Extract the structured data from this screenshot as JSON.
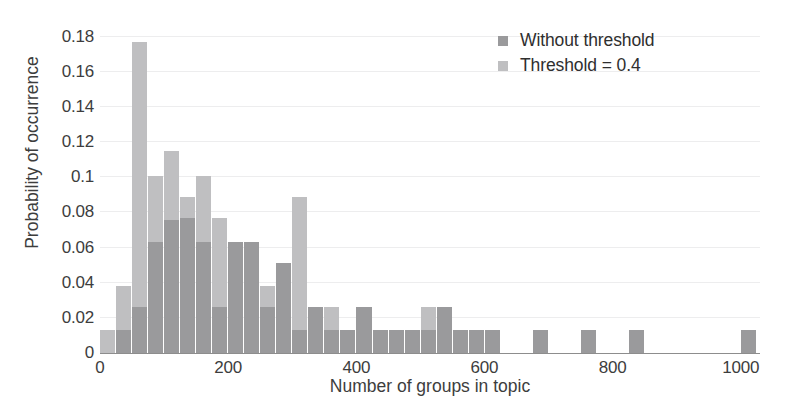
{
  "chart_data": {
    "type": "bar",
    "title": "",
    "subtitle": "",
    "xlabel": "Number of groups in topic",
    "ylabel": "Probability of occurrence",
    "xlim": [
      0,
      1030
    ],
    "ylim": [
      0,
      0.185
    ],
    "grid": "horizontal",
    "legend_position": "top-right",
    "bin_width": 25,
    "xticks": [
      0,
      200,
      400,
      600,
      800,
      1000
    ],
    "xtick_labels": [
      "0",
      "200",
      "400",
      "600",
      "800",
      "1000"
    ],
    "yticks": [
      0,
      0.02,
      0.04,
      0.06,
      0.08,
      0.1,
      0.12,
      0.14,
      0.16,
      0.18
    ],
    "ytick_labels": [
      "0",
      "0.02",
      "0.04",
      "0.06",
      "0.08",
      "0.1",
      "0.12",
      "0.14",
      "0.16",
      "0.18"
    ],
    "x": [
      12,
      37,
      62,
      87,
      112,
      137,
      162,
      187,
      212,
      237,
      262,
      287,
      312,
      337,
      362,
      387,
      412,
      437,
      462,
      487,
      512,
      537,
      562,
      587,
      612,
      637,
      662,
      687,
      712,
      737,
      762,
      787,
      812,
      837,
      862,
      887,
      912,
      937,
      962,
      987,
      1012
    ],
    "series": [
      {
        "name": "Without threshold",
        "color": "#9a9a9c",
        "values": [
          0.0,
          0.013,
          0.026,
          0.063,
          0.076,
          0.077,
          0.063,
          0.026,
          0.063,
          0.063,
          0.026,
          0.051,
          0.013,
          0.026,
          0.013,
          0.013,
          0.026,
          0.013,
          0.013,
          0.013,
          0.013,
          0.026,
          0.013,
          0.013,
          0.013,
          0.0,
          0.0,
          0.013,
          0.0,
          0.0,
          0.013,
          0.0,
          0.0,
          0.013,
          0.0,
          0.0,
          0.0,
          0.0,
          0.0,
          0.0,
          0.013
        ]
      },
      {
        "name": "Threshold = 0.4",
        "color": "#bfbfc1",
        "values": [
          0.013,
          0.038,
          0.177,
          0.101,
          0.115,
          0.089,
          0.101,
          0.077,
          0.063,
          0.063,
          0.038,
          0.038,
          0.089,
          0.026,
          0.026,
          0.0,
          0.026,
          0.013,
          0.013,
          0.013,
          0.026,
          0.013,
          0.013,
          0.013,
          0.0,
          0.0,
          0.0,
          0.0,
          0.0,
          0.0,
          0.0,
          0.0,
          0.0,
          0.0,
          0.0,
          0.0,
          0.0,
          0.0,
          0.0,
          0.0,
          0.0
        ]
      }
    ]
  },
  "legend": {
    "items": [
      {
        "label": "Without threshold",
        "swatch_color": "#9a9a9c"
      },
      {
        "label": "Threshold = 0.4",
        "swatch_color": "#bfbfc1"
      }
    ]
  },
  "colors": {
    "background": "#ffffff",
    "axis": "#8d8d8d",
    "gridline": "#ededee",
    "text": "#3d3d3d"
  }
}
